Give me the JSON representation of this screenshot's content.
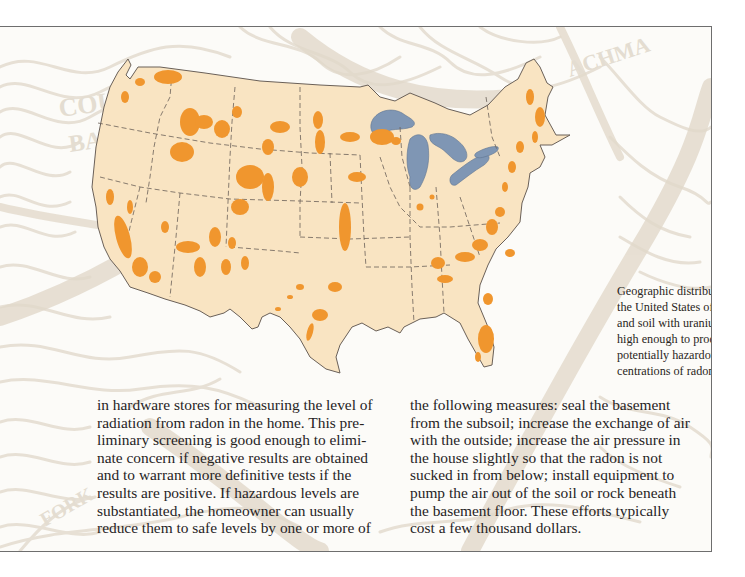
{
  "figure": {
    "type": "map",
    "subject": "United States",
    "legend_colors": {
      "land": "#f9e4c2",
      "uranium_regions": "#f0962e",
      "great_lakes": "#7f96b4",
      "state_borders": "#6a6058",
      "background_contours": "#e6dfd4"
    },
    "caption_lines": [
      "Geographic distribution in",
      "the United States of rock",
      "and soil with uranium levels",
      "high enough to produce",
      "potentially hazardous con-",
      "centrations of radon."
    ]
  },
  "body": {
    "left_column": [
      "in hardware stores for measuring the level of",
      "radiation from radon in the home. This pre-",
      "liminary screening is good enough to elimi-",
      "nate concern if negative results are obtained",
      "and to warrant more definitive tests if the",
      "results are positive. If hazardous levels are",
      "substantiated, the homeowner can usually",
      "reduce them to safe levels by one or more of"
    ],
    "right_column": [
      "the following measures: seal the basement",
      "from the subsoil; increase the exchange of air",
      "with the outside; increase the air pressure in",
      "the house slightly so that the radon is not",
      "sucked in from below; install equipment to",
      "pump the air out of the soil or rock beneath",
      "the basement floor. These efforts typically",
      "cost a few thousand dollars."
    ]
  }
}
